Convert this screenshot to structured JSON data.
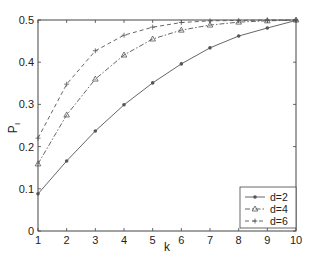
{
  "chart_data": {
    "type": "line",
    "title": "",
    "xlabel": "k",
    "ylabel": "P_I",
    "ylabel_main": "P",
    "ylabel_sub": "I",
    "xlim": [
      1,
      10
    ],
    "ylim": [
      0,
      0.5
    ],
    "x": [
      1,
      2,
      3,
      4,
      5,
      6,
      7,
      8,
      9,
      10
    ],
    "x_ticks": [
      "1",
      "2",
      "3",
      "4",
      "5",
      "6",
      "7",
      "8",
      "9",
      "10"
    ],
    "y_ticks": [
      "0",
      "0.1",
      "0.2",
      "0.3",
      "0.4",
      "0.5"
    ],
    "y_tick_values": [
      0,
      0.1,
      0.2,
      0.3,
      0.4,
      0.5
    ],
    "grid": false,
    "legend_position": "lower right",
    "series": [
      {
        "name": "d=2",
        "line_style": "solid",
        "marker": "dot",
        "values": [
          0.088,
          0.166,
          0.237,
          0.299,
          0.351,
          0.396,
          0.434,
          0.462,
          0.481,
          0.499
        ]
      },
      {
        "name": "d=4",
        "line_style": "dash-dot",
        "marker": "triangle",
        "values": [
          0.159,
          0.275,
          0.36,
          0.417,
          0.455,
          0.476,
          0.488,
          0.495,
          0.498,
          0.5
        ]
      },
      {
        "name": "d=6",
        "line_style": "dashed",
        "marker": "plus",
        "values": [
          0.22,
          0.348,
          0.427,
          0.464,
          0.483,
          0.494,
          0.498,
          0.499,
          0.5,
          0.5
        ]
      }
    ],
    "colors": {
      "axis": "#444444",
      "line": "#555555",
      "background": "#ffffff"
    }
  }
}
